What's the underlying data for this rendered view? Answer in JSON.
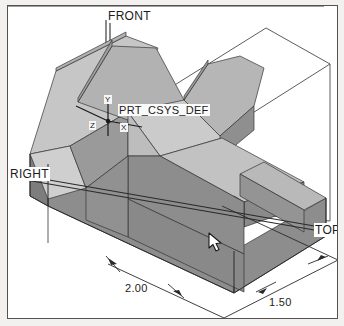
{
  "app": {
    "view_title": "3D Shaded Model View",
    "background_color": "#ffffff",
    "frame_color": "#555152",
    "outer_color": "#f2f1ef"
  },
  "model": {
    "name": "PRT_CSYS_DEF",
    "face_colors": {
      "top_light": "#c4c4c4",
      "top_mid": "#b4b4b4",
      "front_dark": "#8d8d8d",
      "side_mid": "#a3a3a3",
      "slope_light": "#cfcfcf",
      "edge": "#3a3a3a"
    }
  },
  "datum_planes": [
    {
      "id": "front",
      "label": "FRONT",
      "x": 106,
      "y": 8
    },
    {
      "id": "right",
      "label": "RIGHT",
      "x": 8,
      "y": 166
    },
    {
      "id": "top",
      "label": "TOP",
      "x": 313,
      "y": 222
    }
  ],
  "coordinate_system": {
    "label": "PRT_CSYS_DEF",
    "label_x": 116,
    "label_y": 104,
    "axes": [
      {
        "id": "y-axis",
        "label": "Y",
        "x": 101,
        "y": 94
      },
      {
        "id": "z-axis",
        "label": "Z",
        "x": 87,
        "y": 120
      },
      {
        "id": "x-axis",
        "label": "X",
        "x": 117,
        "y": 122
      }
    ]
  },
  "dimensions": [
    {
      "id": "dim-width",
      "value": "2.00",
      "x": 124,
      "y": 282
    },
    {
      "id": "dim-depth",
      "value": "1.50",
      "x": 268,
      "y": 296
    }
  ],
  "cursor": {
    "name": "mouse-pointer",
    "x": 207,
    "y": 231
  }
}
